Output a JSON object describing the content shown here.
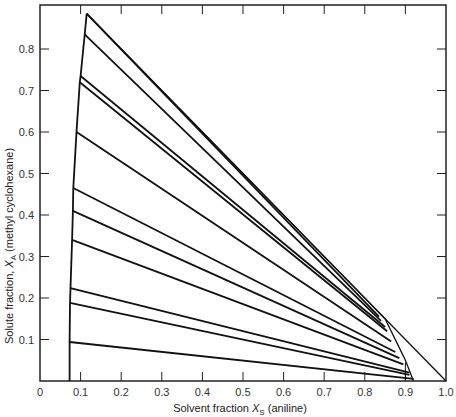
{
  "chart_data": {
    "type": "line",
    "title": "",
    "xlabel": "Solvent fraction X_S (aniline)",
    "ylabel": "Solute fraction, X_A (methyl cyclohexane)",
    "xlabel_parts": {
      "pre": "Solvent fraction ",
      "var": "X",
      "sub": "S",
      "post": " (aniline)"
    },
    "ylabel_parts": {
      "pre": "Solute fraction, ",
      "var": "X",
      "sub": "A",
      "post": " (methyl cyclohexane)"
    },
    "xlim": [
      0,
      1.0
    ],
    "ylim": [
      0,
      0.9
    ],
    "x_ticks": [
      "0",
      "0.1",
      "0.2",
      "0.3",
      "0.4",
      "0.5",
      "0.6",
      "0.7",
      "0.8",
      "0.9",
      "1.0"
    ],
    "y_ticks": [
      "0.1",
      "0.2",
      "0.3",
      "0.4",
      "0.5",
      "0.6",
      "0.7",
      "0.8"
    ],
    "grid": false,
    "legend": null,
    "boundaries": {
      "raffinate_left": [
        [
          0.073,
          0.0
        ],
        [
          0.073,
          0.094
        ],
        [
          0.074,
          0.188
        ],
        [
          0.075,
          0.224
        ],
        [
          0.079,
          0.34
        ],
        [
          0.081,
          0.41
        ],
        [
          0.082,
          0.465
        ],
        [
          0.09,
          0.6
        ],
        [
          0.098,
          0.72
        ],
        [
          0.1,
          0.735
        ],
        [
          0.11,
          0.835
        ],
        [
          0.115,
          0.885
        ]
      ],
      "extract_right": [
        [
          0.115,
          0.885
        ],
        [
          0.85,
          0.15
        ],
        [
          0.88,
          0.09
        ],
        [
          0.9,
          0.05
        ],
        [
          0.92,
          0.0
        ]
      ],
      "outer_line": [
        [
          0.115,
          0.885
        ],
        [
          1.0,
          0.0
        ]
      ]
    },
    "tie_lines": [
      {
        "x1": 0.073,
        "y1": 0.094,
        "x2": 0.92,
        "y2": 0.005
      },
      {
        "x1": 0.074,
        "y1": 0.188,
        "x2": 0.91,
        "y2": 0.015
      },
      {
        "x1": 0.075,
        "y1": 0.224,
        "x2": 0.91,
        "y2": 0.02
      },
      {
        "x1": 0.079,
        "y1": 0.34,
        "x2": 0.895,
        "y2": 0.04
      },
      {
        "x1": 0.081,
        "y1": 0.41,
        "x2": 0.885,
        "y2": 0.055
      },
      {
        "x1": 0.082,
        "y1": 0.465,
        "x2": 0.875,
        "y2": 0.07
      },
      {
        "x1": 0.09,
        "y1": 0.6,
        "x2": 0.865,
        "y2": 0.095
      },
      {
        "x1": 0.098,
        "y1": 0.72,
        "x2": 0.855,
        "y2": 0.12
      },
      {
        "x1": 0.1,
        "y1": 0.735,
        "x2": 0.85,
        "y2": 0.13
      },
      {
        "x1": 0.11,
        "y1": 0.835,
        "x2": 0.84,
        "y2": 0.145
      },
      {
        "x1": 0.115,
        "y1": 0.885,
        "x2": 0.835,
        "y2": 0.155
      }
    ]
  }
}
